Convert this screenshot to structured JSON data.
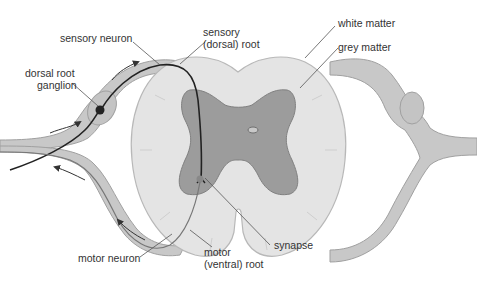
{
  "diagram": {
    "labels": {
      "sensory_neuron": "sensory neuron",
      "sensory_root_line1": "sensory",
      "sensory_root_line2": "(dorsal) root",
      "dorsal_root_ganglion_line1": "dorsal root",
      "dorsal_root_ganglion_line2": "ganglion",
      "white_matter": "white matter",
      "grey_matter": "grey matter",
      "motor_neuron": "motor neuron",
      "motor_root_line1": "motor",
      "motor_root_line2": "(ventral) root",
      "synapse": "synapse"
    },
    "colors": {
      "white_matter": "#e4e4e4",
      "white_matter_stroke": "#b8b8b8",
      "grey_matter": "#9c9c9c",
      "grey_matter_stroke": "#808080",
      "nerve": "#c8c8c8",
      "nerve_stroke": "#a0a0a0",
      "neuron_path": "#222222",
      "arrow": "#333333",
      "leader_line": "#555555"
    }
  }
}
